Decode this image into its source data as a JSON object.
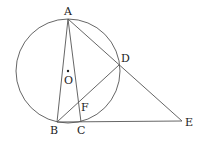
{
  "diagram": {
    "type": "geometry",
    "circle": {
      "center": "O",
      "cx": 68,
      "cy": 71,
      "r": 52
    },
    "points": {
      "A": {
        "label": "A",
        "x": 68,
        "y": 19,
        "lx": 64,
        "ly": 15
      },
      "B": {
        "label": "B",
        "x": 57,
        "y": 122,
        "lx": 50,
        "ly": 134
      },
      "C": {
        "label": "C",
        "x": 81,
        "y": 122,
        "lx": 77,
        "ly": 134
      },
      "D": {
        "label": "D",
        "x": 119,
        "y": 65,
        "lx": 121,
        "ly": 62
      },
      "E": {
        "label": "E",
        "x": 182,
        "y": 121,
        "lx": 185,
        "ly": 126
      },
      "F": {
        "label": "F",
        "x": 80,
        "y": 104,
        "lx": 81,
        "ly": 111
      },
      "O": {
        "label": "O",
        "x": 68,
        "y": 71,
        "lx": 64,
        "ly": 83
      }
    },
    "segments": [
      "AB",
      "AC",
      "AE",
      "BD",
      "BE"
    ]
  }
}
